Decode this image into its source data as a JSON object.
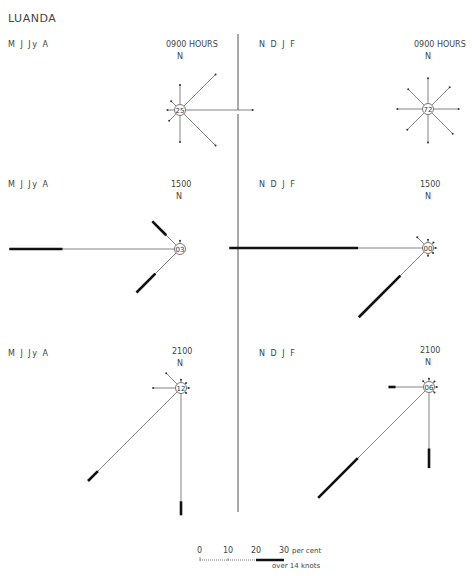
{
  "title": "LUANDA",
  "north_label": "N",
  "seasons": [
    "M J Jy A",
    "N D J F"
  ],
  "chart_data": {
    "type": "wind-rose",
    "title": "LUANDA",
    "directions": [
      "N",
      "NE",
      "E",
      "SE",
      "S",
      "SW",
      "W",
      "NW"
    ],
    "units": "per cent",
    "scale": {
      "ticks": [
        0,
        10,
        20,
        30
      ],
      "label": "per cent",
      "thick_label": "over 14 knots",
      "px_per_percent": 2.8
    },
    "panels": [
      {
        "id": "0900-MJJyA",
        "hour": "0900 HOURS",
        "season": "M J Jy A",
        "calm": "25",
        "cx": 180,
        "cy": 110,
        "rays": {
          "N": 7,
          "NE": 16,
          "E": 24,
          "SE": 16,
          "S": 9.5,
          "SW": 3.5,
          "W": 2.5,
          "NW": 2.5
        },
        "strong": {}
      },
      {
        "id": "0900-NDJF",
        "hour": "0900 HOURS",
        "season": "N D J F",
        "calm": "72",
        "cx": 428,
        "cy": 109,
        "rays": {
          "N": 9,
          "NE": 9,
          "E": 9,
          "SE": 10.5,
          "S": 10,
          "SW": 8.5,
          "W": 9,
          "NW": 8
        },
        "strong": {}
      },
      {
        "id": "1500-MJJyA",
        "hour": "1500",
        "season": "M J Jy A",
        "calm": "03",
        "cx": 180,
        "cy": 249,
        "rays": {
          "N": 1,
          "W": 59,
          "NW": 12,
          "SW": 20
        },
        "strong": {
          "W": 19,
          "NW": 7,
          "SW": 9.5
        }
      },
      {
        "id": "1500-NDJF",
        "hour": "1500",
        "season": "N D J F",
        "calm": "00",
        "cx": 428,
        "cy": 248,
        "rays": {
          "N": 1,
          "W": 69,
          "NW": 3.5,
          "SW": 33,
          "NE": 0.8,
          "E": 0.8,
          "SE": 0.6,
          "S": 0.8
        },
        "strong": {
          "W": 46,
          "SW": 21
        }
      },
      {
        "id": "2100-MJJyA",
        "hour": "2100",
        "season": "M J Jy A",
        "calm": "12",
        "cx": 181,
        "cy": 388,
        "rays": {
          "N": 1,
          "W": 8,
          "NW": 5.5,
          "SW": 45,
          "S": 43.5,
          "NE": 0.6,
          "E": 0.8,
          "SE": 0.6
        },
        "strong": {
          "SW": 5,
          "S": 5
        }
      },
      {
        "id": "2100-NDJF",
        "hour": "2100",
        "season": "N D J F",
        "calm": "06",
        "cx": 429,
        "cy": 387,
        "rays": {
          "N": 1,
          "W": 12.5,
          "NW": 1,
          "SW": 54,
          "S": 27,
          "NE": 0.8,
          "E": 0.8,
          "SE": 0.8
        },
        "strong": {
          "W": 2.5,
          "SW": 20,
          "S": 7
        }
      }
    ]
  },
  "legend": {
    "ticks": [
      "0",
      "10",
      "20",
      "30"
    ],
    "unit": "per cent",
    "thick_label": "over 14 knots"
  }
}
